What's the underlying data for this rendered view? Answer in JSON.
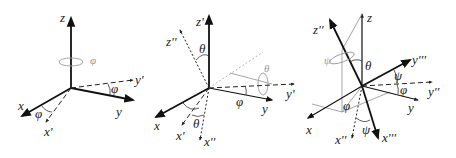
{
  "diagram": {
    "panels": [
      {
        "id": "rotation-phi",
        "axis_labels": {
          "z": "z",
          "x": "x",
          "y": "y",
          "x_prime": "x'",
          "y_prime": "y'"
        },
        "angle_labels": {
          "rotation": "φ",
          "x_angle": "φ",
          "y_angle": "φ"
        }
      },
      {
        "id": "rotation-theta",
        "axis_labels": {
          "z_prime": "z'",
          "z_dprime": "z''",
          "x": "x",
          "y": "y",
          "x_prime": "x'",
          "x_dprime": "x''",
          "y_prime": "y'"
        },
        "angle_labels": {
          "z_angle": "θ",
          "rotation": "θ",
          "x_angle": "θ",
          "y_angle": "φ"
        }
      },
      {
        "id": "rotation-psi",
        "axis_labels": {
          "z": "z",
          "z_dprime": "z''",
          "x": "x",
          "y": "y",
          "x_dprime": "x''",
          "x_tprime": "x'''",
          "y_dprime": "y''",
          "y_tprime": "y'''"
        },
        "angle_labels": {
          "rotation": "ψ",
          "theta": "θ",
          "psi_y": "ψ",
          "phi_y": "φ",
          "phi_xy": "φ",
          "psi_x": "ψ"
        }
      }
    ]
  }
}
